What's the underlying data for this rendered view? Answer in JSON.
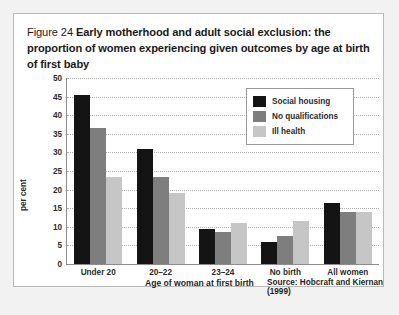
{
  "figure": {
    "number": "Figure 24",
    "title": "Early motherhood and adult social exclusion: the proportion of women experiencing given outcomes by age at birth of first baby"
  },
  "colors": {
    "series_social_housing": "#141414",
    "series_no_qualifications": "#7e7e7e",
    "series_ill_health": "#c6c6c6",
    "panel_background": "#ffffff",
    "frame_background": "#f2f2f2",
    "gridline": "#b0b0b0",
    "axis": "#8c8c8c"
  },
  "chart_data": {
    "type": "bar",
    "title": "Early motherhood and adult social exclusion: the proportion of women experiencing given outcomes by age at birth of first baby",
    "categories": [
      "Under 20",
      "20–22",
      "23–24",
      "No birth",
      "All women"
    ],
    "series": [
      {
        "name": "Social housing",
        "values": [
          45.5,
          31.0,
          9.5,
          6.0,
          16.5
        ]
      },
      {
        "name": "No qualifications",
        "values": [
          36.5,
          23.5,
          8.5,
          7.5,
          14.0
        ]
      },
      {
        "name": "Ill health",
        "values": [
          23.5,
          19.0,
          11.0,
          11.5,
          14.0
        ]
      }
    ],
    "xlabel": "Age of woman at first birth",
    "ylabel": "per cent",
    "ylim": [
      0,
      50
    ],
    "yticks": [
      0,
      5,
      10,
      15,
      20,
      25,
      30,
      35,
      40,
      45,
      50
    ],
    "ytick_labels": [
      "0",
      "5",
      "10",
      "15",
      "20",
      "25",
      "30",
      "35",
      "40",
      "45",
      "50"
    ],
    "grid": true,
    "legend_position": "top-right",
    "source": "Source: Hobcraft and Kiernan (1999)"
  }
}
